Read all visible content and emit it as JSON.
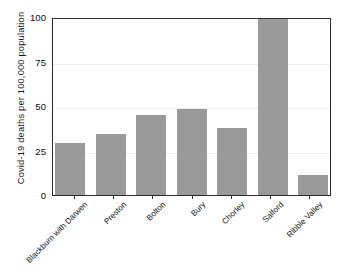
{
  "chart_data": {
    "type": "bar",
    "title": "",
    "xlabel": "",
    "ylabel": "Covid-19 deaths per 100,000 population",
    "ylim": [
      0,
      100
    ],
    "yticks": [
      100,
      75,
      50,
      25,
      0
    ],
    "grid": true,
    "legend": false,
    "bar_color": "#9a9a9a",
    "axis_color": "#2b2b2b",
    "categories": [
      "Blackburn with Darwen",
      "Preston",
      "Bolton",
      "Bury",
      "Chorley",
      "Salford",
      "Ribble Valley"
    ],
    "values": [
      29,
      34,
      45,
      48.5,
      37.5,
      99,
      11
    ]
  }
}
